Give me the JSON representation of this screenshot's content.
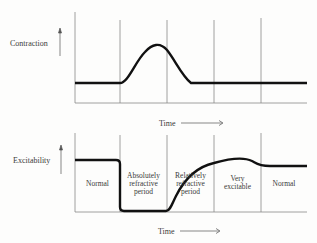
{
  "top_panel": {
    "y_label": "Contraction",
    "x_label": "Time"
  },
  "bottom_panel": {
    "y_label": "Excitability",
    "x_label": "Time",
    "phases": [
      {
        "line1": "Normal",
        "line2": "",
        "line3": ""
      },
      {
        "line1": "Absolutely",
        "line2": "refractive",
        "line3": "period"
      },
      {
        "line1": "Relatively",
        "line2": "refractive",
        "line3": "period"
      },
      {
        "line1": "Very",
        "line2": "excitable",
        "line3": ""
      },
      {
        "line1": "Normal",
        "line2": "",
        "line3": ""
      }
    ]
  },
  "colors": {
    "curve": "#111111",
    "axis": "#777777",
    "text": "#3a3a3a"
  }
}
